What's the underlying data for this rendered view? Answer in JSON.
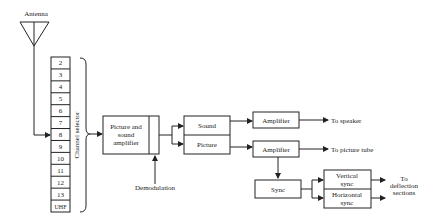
{
  "diagram": {
    "antenna_label": "Antenna",
    "channel_selector_label": "Channel selector",
    "channels": [
      "2",
      "3",
      "4",
      "5",
      "6",
      "7",
      "8",
      "9",
      "10",
      "11",
      "12",
      "13",
      "UHF"
    ],
    "picture_sound_amp": [
      "Picture and",
      "sound",
      "amplifier"
    ],
    "demodulation_label": "Demodulation",
    "sound_label": "Sound",
    "picture_label": "Picture",
    "amplifier_sound": "Amplifier",
    "amplifier_picture": "Amplifier",
    "to_speaker": "To speaker",
    "to_picture_tube": "To picture tube",
    "sync_label": "Sync",
    "vertical_sync": [
      "Vertical",
      "sync"
    ],
    "horizontal_sync": [
      "Horizontal",
      "sync"
    ],
    "to_deflection": [
      "To",
      "deflection",
      "sections"
    ]
  }
}
